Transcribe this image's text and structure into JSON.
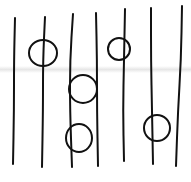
{
  "canvas": {
    "width": 191,
    "height": 182,
    "background": "#ffffff",
    "ink": "#111111",
    "stroke_width": 2
  },
  "paper_fold": {
    "y": 69,
    "color": "#e4e4e4"
  },
  "lines": [
    {
      "id": "line-1",
      "points": [
        [
          15,
          18
        ],
        [
          14,
          60
        ],
        [
          14,
          110
        ],
        [
          13,
          164
        ]
      ]
    },
    {
      "id": "line-2",
      "points": [
        [
          45,
          17
        ],
        [
          43,
          60
        ],
        [
          43,
          110
        ],
        [
          42,
          167
        ]
      ]
    },
    {
      "id": "line-3",
      "points": [
        [
          73,
          14
        ],
        [
          70,
          60
        ],
        [
          70,
          110
        ],
        [
          72,
          167
        ]
      ]
    },
    {
      "id": "line-4",
      "points": [
        [
          96,
          13
        ],
        [
          97,
          60
        ],
        [
          97,
          110
        ],
        [
          98,
          166
        ]
      ]
    },
    {
      "id": "line-5",
      "points": [
        [
          125,
          9
        ],
        [
          124,
          60
        ],
        [
          123,
          110
        ],
        [
          124,
          161
        ]
      ]
    },
    {
      "id": "line-6",
      "points": [
        [
          151,
          8
        ],
        [
          151,
          60
        ],
        [
          152,
          110
        ],
        [
          153,
          164
        ]
      ]
    },
    {
      "id": "line-7",
      "points": [
        [
          182,
          6
        ],
        [
          181,
          60
        ],
        [
          178,
          110
        ],
        [
          176,
          166
        ]
      ]
    }
  ],
  "circles": [
    {
      "id": "circle-1",
      "cx": 43,
      "cy": 53,
      "rx": 14,
      "ry": 13,
      "on_line": "line-2"
    },
    {
      "id": "circle-2",
      "cx": 83,
      "cy": 89,
      "rx": 14,
      "ry": 14,
      "on_line": "line-3"
    },
    {
      "id": "circle-3",
      "cx": 119,
      "cy": 49,
      "rx": 11,
      "ry": 11,
      "on_line": "line-5"
    },
    {
      "id": "circle-4",
      "cx": 79,
      "cy": 138,
      "rx": 13,
      "ry": 14,
      "on_line": "line-3"
    },
    {
      "id": "circle-5",
      "cx": 157,
      "cy": 128,
      "rx": 13,
      "ry": 13,
      "on_line": "line-6"
    }
  ]
}
